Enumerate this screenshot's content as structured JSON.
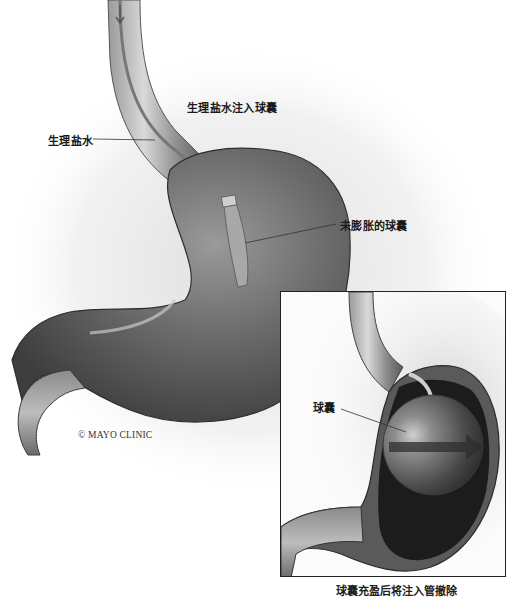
{
  "figure": {
    "credit": "© MAYO CLINIC",
    "main_view": {
      "labels": {
        "saline_into_balloon": "生理盐水注入球囊",
        "saline": "生理盐水",
        "uninflated_balloon": "未膨胀的球囊"
      }
    },
    "inset_view": {
      "labels": {
        "balloon": "球囊"
      },
      "caption": "球囊充盈后将注入管撤除"
    },
    "colors": {
      "stomach_dark": "#4a4a4a",
      "stomach_mid": "#7a7a7a",
      "stomach_light": "#b8b8b8",
      "interior": "#1c1c1c",
      "border": "#222222"
    }
  }
}
